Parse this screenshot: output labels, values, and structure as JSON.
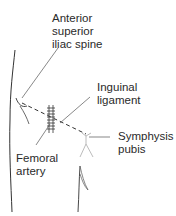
{
  "diagram": {
    "labels": {
      "asis": "Anterior\nsuperior\niliac spine",
      "inguinal_ligament": "Inguinal\nligament",
      "symphysis_pubis": "Symphysis\npubis",
      "femoral_artery": "Femoral\nartery"
    },
    "colors": {
      "ink": "#2a2a2a",
      "line": "#555555",
      "faint": "#aaaaaa"
    }
  }
}
